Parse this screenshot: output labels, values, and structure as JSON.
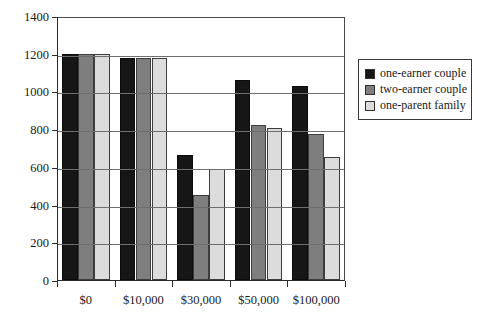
{
  "chart_data": {
    "type": "bar",
    "title": "",
    "subtitle": "",
    "xlabel": "",
    "ylabel": "",
    "categories": [
      "$0",
      "$10,000",
      "$30,000",
      "$50,000",
      "$100,000"
    ],
    "series": [
      {
        "name": "one-earner couple",
        "color": "#161616",
        "values": [
          1200,
          1175,
          665,
          1060,
          1030
        ]
      },
      {
        "name": "two-earner couple",
        "color": "#7e7e7e",
        "values": [
          1200,
          1175,
          450,
          820,
          775
        ]
      },
      {
        "name": "one-parent family",
        "color": "#dcdcdc",
        "values": [
          1200,
          1175,
          590,
          805,
          650
        ]
      }
    ],
    "ylim": [
      0,
      1400
    ],
    "ytick_values": [
      0,
      200,
      400,
      600,
      800,
      1000,
      1200,
      1400
    ],
    "ytick_labels": [
      "0",
      "200",
      "400",
      "600",
      "800",
      "1000",
      "1200",
      "1400"
    ],
    "grid": "horizontal",
    "legend_position": "right",
    "legend_entries": [
      "one-earner couple",
      "two-earner couple",
      "one-parent family"
    ]
  }
}
